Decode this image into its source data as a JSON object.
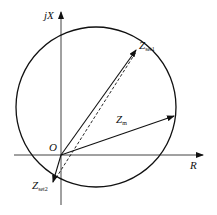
{
  "diagram": {
    "type": "impedance-circle",
    "axes": {
      "x_label": "R",
      "y_label": "jX"
    },
    "origin_label": "O",
    "vectors": [
      {
        "name": "Z",
        "subscript": "set1",
        "style": "solid"
      },
      {
        "name": "Z",
        "subscript": "m",
        "style": "solid"
      },
      {
        "name": "Z",
        "subscript": "set2",
        "style": "solid"
      }
    ],
    "dashed_line": "diameter from Zset2 to Zset1",
    "colors": {
      "stroke": "#111111",
      "background": "#ffffff"
    }
  }
}
